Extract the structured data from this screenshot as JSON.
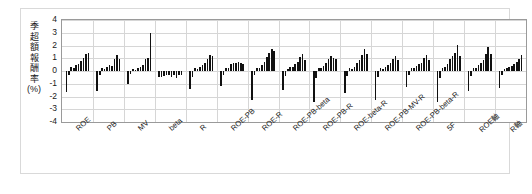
{
  "chart_data": {
    "type": "bar",
    "title": "",
    "subtitle": "",
    "xlabel": "",
    "ylabel": "季超額報酬率(%)",
    "ylim": [
      -4,
      4
    ],
    "yticks": [
      4,
      3,
      2,
      1,
      0,
      -1,
      -2,
      -3,
      -4
    ],
    "grid": true,
    "legend": "none",
    "bars_per_group": 10,
    "bar_color": "#111111",
    "categories": [
      "ROE",
      "PB",
      "MV",
      "beta",
      "R",
      "ROE-PB",
      "ROE-R",
      "ROE-PB-beta",
      "ROE-PB-R",
      "ROE-beta-R",
      "ROE-PB-MV-R",
      "ROE-PB-beta-R",
      "5F",
      "ROE軸",
      "R軸"
    ],
    "groups": [
      {
        "label": "ROE",
        "values": [
          -1.65,
          -0.35,
          0.3,
          0.2,
          0.45,
          0.55,
          0.75,
          1.05,
          1.3,
          1.4
        ]
      },
      {
        "label": "PB",
        "values": [
          -1.55,
          -0.3,
          0.25,
          0.15,
          0.3,
          0.45,
          0.4,
          0.95,
          1.25,
          0.95
        ]
      },
      {
        "label": "MV",
        "values": [
          -1.05,
          -0.25,
          0.15,
          0.1,
          0.2,
          0.35,
          0.5,
          0.95,
          1.05,
          2.95
        ]
      },
      {
        "label": "beta",
        "values": [
          -0.5,
          -0.45,
          -0.4,
          -0.35,
          -0.3,
          -0.45,
          -0.35,
          -0.55,
          -0.3,
          -0.35
        ]
      },
      {
        "label": "R",
        "values": [
          -1.45,
          -0.45,
          0.2,
          0.15,
          0.35,
          0.45,
          0.6,
          0.95,
          1.25,
          1.2
        ]
      },
      {
        "label": "ROE-PB",
        "values": [
          -1.2,
          -0.3,
          0.2,
          0.25,
          0.55,
          0.65,
          0.6,
          0.7,
          0.6,
          0.55
        ]
      },
      {
        "label": "ROE-R",
        "values": [
          -2.3,
          -0.35,
          0.25,
          0.2,
          0.45,
          0.7,
          1.1,
          1.45,
          1.7,
          1.55
        ]
      },
      {
        "label": "ROE-PB-beta",
        "values": [
          -1.5,
          -0.4,
          0.15,
          0.3,
          0.35,
          0.55,
          0.7,
          1.1,
          1.3,
          0.9
        ]
      },
      {
        "label": "ROE-PB-R",
        "values": [
          -2.4,
          -0.55,
          0.25,
          0.2,
          0.4,
          0.6,
          0.95,
          1.2,
          1.05,
          0.95
        ]
      },
      {
        "label": "ROE-beta-R",
        "values": [
          -1.7,
          -0.4,
          0.2,
          0.15,
          0.35,
          0.6,
          0.85,
          1.25,
          1.75,
          1.35
        ]
      },
      {
        "label": "ROE-PB-MV-R",
        "values": [
          -2.3,
          -0.5,
          0.2,
          0.15,
          0.3,
          0.45,
          0.6,
          0.95,
          1.15,
          0.9
        ]
      },
      {
        "label": "ROE-PB-beta-R",
        "values": [
          -1.25,
          -0.35,
          0.2,
          0.25,
          0.4,
          0.55,
          0.65,
          1.05,
          1.25,
          0.85
        ]
      },
      {
        "label": "5F",
        "values": [
          -2.45,
          -0.55,
          0.25,
          0.3,
          0.55,
          0.95,
          1.15,
          1.45,
          2.05,
          1.2
        ]
      },
      {
        "label": "ROE軸",
        "values": [
          -1.55,
          -0.4,
          0.2,
          0.25,
          0.45,
          0.6,
          0.85,
          1.3,
          1.9,
          1.35
        ]
      },
      {
        "label": "R軸",
        "values": [
          -1.3,
          -0.35,
          0.15,
          0.2,
          0.3,
          0.4,
          0.55,
          0.7,
          0.95,
          1.25
        ]
      }
    ]
  }
}
